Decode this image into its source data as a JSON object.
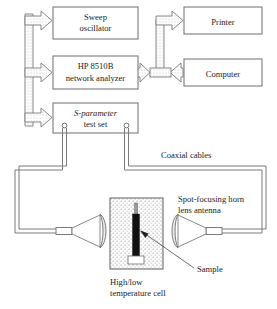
{
  "figure": {
    "kind": "block-diagram"
  },
  "boxes": [
    {
      "id": "sweep-oscillator",
      "line1": "Sweep",
      "line2": "oscillator",
      "italic_first_word": false
    },
    {
      "id": "network-analyzer",
      "line1": "HP 8510B",
      "line2": "network analyzer",
      "italic_first_word": false
    },
    {
      "id": "s-parameter-test-set",
      "line1": "S-parameter",
      "line2": "test set",
      "italic_first_word": true,
      "italic_token": "S"
    },
    {
      "id": "printer",
      "line1": "Printer",
      "line2": "",
      "italic_first_word": false
    },
    {
      "id": "computer",
      "line1": "Computer",
      "line2": "",
      "italic_first_word": false
    }
  ],
  "labels": {
    "coaxial_cables": "Coaxial cables",
    "spot_focusing_line1": "Spot-focusing horn",
    "spot_focusing_line2": "lens antenna",
    "sample": "Sample",
    "cell_line1": "High/low",
    "cell_line2": "temperature cell"
  },
  "icons": {
    "bus_arrow_left": "block-arrow-right-icon",
    "bus_arrow_right": "block-arrow-right-icon",
    "analyzer_computer_link": "double-headed-arrow-icon",
    "sample_pointer": "leader-arrow-icon",
    "horn_left": "horn-lens-antenna-icon",
    "horn_right": "horn-lens-antenna-icon",
    "test_set_port_left": "coax-port-icon",
    "test_set_port_right": "coax-port-icon"
  },
  "colors": {
    "line": "#6e6e6e",
    "text": "#1c1c1c",
    "sample_fill": "#111111",
    "background": "#ffffff",
    "stipple": "#9a9a9a"
  },
  "arrow_count": {
    "left_bus_branches": 3,
    "right_bus_branches": 1,
    "bidirectional": 1
  }
}
